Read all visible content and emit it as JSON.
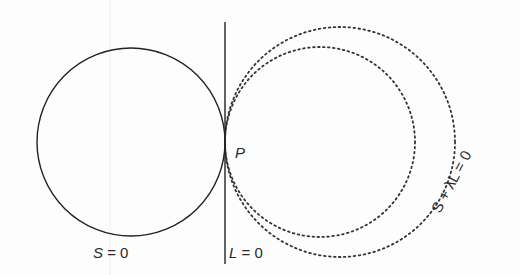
{
  "diagram": {
    "type": "geometry-family-of-circles",
    "colors": {
      "stroke": "#222222",
      "dotted": "#333333",
      "text": "#2a2a2a",
      "background": "#fdfdfd"
    },
    "elements": {
      "circle_s": {
        "label": "S = 0",
        "style": "solid",
        "cx": 130,
        "cy": 142,
        "r": 92
      },
      "line_l": {
        "label": "L = 0",
        "style": "solid",
        "x": 225,
        "y1": 22,
        "y2": 264
      },
      "point_p": {
        "label": "P",
        "x": 225,
        "y": 142
      },
      "family_circle_inner": {
        "style": "dotted",
        "cx": 320,
        "cy": 142,
        "r": 95
      },
      "family_circle_outer": {
        "style": "dotted",
        "cx": 339,
        "cy": 142,
        "r": 113
      },
      "family_label": "S + λL = 0"
    },
    "labels": {
      "s_eq": "S = 0",
      "l_eq": "L = 0",
      "p": "P",
      "family": "S + λL = 0"
    }
  }
}
